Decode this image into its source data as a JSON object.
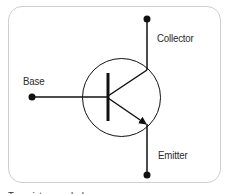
{
  "diagram": {
    "type": "npn-transistor-symbol",
    "labels": {
      "collector": "Collector",
      "base": "Base",
      "emitter": "Emitter"
    },
    "caption": "Transistor symbol",
    "colors": {
      "stroke": "#111111",
      "frame_border": "#cfcfcf",
      "text": "#2b2b2b"
    }
  }
}
